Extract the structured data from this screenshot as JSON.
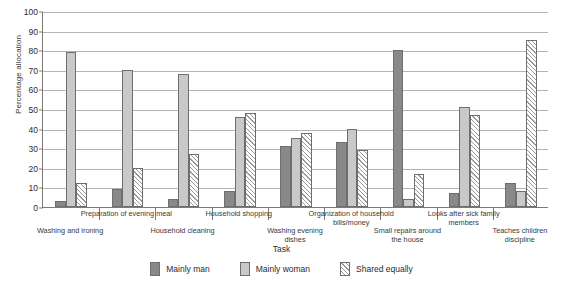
{
  "chart_data": {
    "type": "bar",
    "title": "",
    "xlabel": "Task",
    "ylabel": "Percentage allocation",
    "ylim": [
      0,
      100
    ],
    "ytick_step": 10,
    "ytick_labels": [
      "0",
      "10",
      "20",
      "30",
      "40",
      "50",
      "60",
      "70",
      "80",
      "90",
      "100"
    ],
    "grid": true,
    "legend_position": "bottom",
    "categories": [
      "Washing and ironing",
      "Preparation of evening meal",
      "Household cleaning",
      "Household shopping",
      "Washing evening dishes",
      "Organization of household bills/money",
      "Small repairs around the house",
      "Looks after sick family members",
      "Teaches children discipline"
    ],
    "category_label_lines": [
      [
        "Washing and ironing"
      ],
      [
        "Preparation of evening meal"
      ],
      [
        "Household cleaning"
      ],
      [
        "Household shopping"
      ],
      [
        "Washing evening",
        "dishes"
      ],
      [
        "Organization of household",
        "bills/money"
      ],
      [
        "Small repairs around",
        "the house"
      ],
      [
        "Looks after sick family",
        "members"
      ],
      [
        "Teaches children",
        "discipline"
      ]
    ],
    "series": [
      {
        "name": "Mainly man",
        "color": "#898989",
        "values": [
          3,
          9,
          4,
          8,
          31,
          33,
          80,
          7,
          12
        ]
      },
      {
        "name": "Mainly woman",
        "color": "#c9c9c9",
        "values": [
          79,
          70,
          68,
          46,
          35,
          40,
          4,
          51,
          8
        ]
      },
      {
        "name": "Shared equally",
        "color": "#ffffff",
        "hatch": "diagonal",
        "values": [
          12,
          20,
          27,
          48,
          38,
          29,
          17,
          47,
          85
        ]
      }
    ]
  },
  "legend": {
    "items": [
      {
        "label": "Mainly man"
      },
      {
        "label": "Mainly woman"
      },
      {
        "label": "Shared equally"
      }
    ]
  }
}
